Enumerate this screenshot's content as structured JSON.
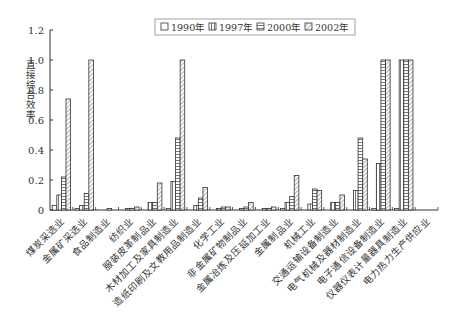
{
  "chart_data": {
    "type": "bar",
    "title": "",
    "xlabel": "",
    "ylabel": "直接综合效率",
    "ylim": [
      0,
      1.2
    ],
    "yticks": [
      "0",
      "0.2",
      "0.4",
      "0.6",
      "0.8",
      "1.0",
      "1.2"
    ],
    "grid": false,
    "legend_position": "top",
    "categories": [
      "煤炭采选业",
      "金属矿采选业",
      "食品制造业",
      "纺织业",
      "服装皮革制品业",
      "木材加工及家具制造业",
      "造纸印刷及文教用品制造业",
      "化学工业",
      "非金属矿物制品业",
      "金属冶炼及压延加工业",
      "金属制品业",
      "机械工业",
      "交通运输设备制造业",
      "电气机械及器材制造业",
      "电子通信设备制造业",
      "仪器仪表计量器具制造业",
      "电力热力生产供应业"
    ],
    "series": [
      {
        "name": "1990年",
        "pattern": "empty",
        "values": [
          0.03,
          0.01,
          0.0,
          0.0,
          0.0,
          0.01,
          0.0,
          0.0,
          0.0,
          0.0,
          0.01,
          0.0,
          0.0,
          0.0,
          0.01,
          0.01,
          0.0
        ]
      },
      {
        "name": "1997年",
        "pattern": "vertical",
        "values": [
          0.1,
          0.03,
          0.0,
          0.01,
          0.05,
          0.19,
          0.03,
          0.01,
          0.01,
          0.01,
          0.05,
          0.04,
          0.05,
          0.13,
          0.31,
          1.0,
          0.0
        ]
      },
      {
        "name": "2000年",
        "pattern": "horizontal",
        "values": [
          0.22,
          0.11,
          0.01,
          0.01,
          0.05,
          0.48,
          0.08,
          0.02,
          0.02,
          0.01,
          0.09,
          0.14,
          0.05,
          0.48,
          1.0,
          1.0,
          0.0
        ]
      },
      {
        "name": "2002年",
        "pattern": "diagonal",
        "values": [
          0.74,
          1.0,
          0.0,
          0.02,
          0.18,
          1.0,
          0.15,
          0.02,
          0.05,
          0.02,
          0.23,
          0.13,
          0.1,
          0.34,
          1.0,
          1.0,
          0.0
        ]
      }
    ]
  },
  "legend": {
    "items": [
      "1990年",
      "1997年",
      "2000年",
      "2002年"
    ]
  }
}
